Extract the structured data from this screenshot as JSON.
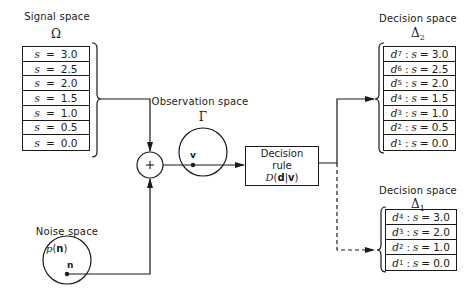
{
  "signal_space": {
    "title": "Signal space",
    "symbol": "Ω",
    "rows": [
      {
        "var": "s",
        "eq": "=",
        "value": "3.0"
      },
      {
        "var": "s",
        "eq": "=",
        "value": "2.5"
      },
      {
        "var": "s",
        "eq": "=",
        "value": "2.0"
      },
      {
        "var": "s",
        "eq": "=",
        "value": "1.5"
      },
      {
        "var": "s",
        "eq": "=",
        "value": "1.0"
      },
      {
        "var": "s",
        "eq": "=",
        "value": "0.5"
      },
      {
        "var": "s",
        "eq": "=",
        "value": "0.0"
      }
    ]
  },
  "noise_space": {
    "title": "Noise space",
    "density": "p(n)",
    "density_func": "p",
    "density_arg": "n",
    "point": "n"
  },
  "summer": {
    "symbol": "+"
  },
  "observation_space": {
    "title": "Observation space",
    "symbol": "Γ",
    "point": "v"
  },
  "decision_rule": {
    "line1": "Decision",
    "line2": "rule",
    "func": "D",
    "arg1": "d",
    "arg2": "v"
  },
  "decision_space_2": {
    "title": "Decision space",
    "symbol": "Δ",
    "subscript": "2",
    "rows": [
      {
        "d": "d",
        "sub": "7",
        "var": "s",
        "value": "3.0"
      },
      {
        "d": "d",
        "sub": "6",
        "var": "s",
        "value": "2.5"
      },
      {
        "d": "d",
        "sub": "5",
        "var": "s",
        "value": "2.0"
      },
      {
        "d": "d",
        "sub": "4",
        "var": "s",
        "value": "1.5"
      },
      {
        "d": "d",
        "sub": "3",
        "var": "s",
        "value": "1.0"
      },
      {
        "d": "d",
        "sub": "2",
        "var": "s",
        "value": "0.5"
      },
      {
        "d": "d",
        "sub": "1",
        "var": "s",
        "value": "0.0"
      }
    ]
  },
  "decision_space_1": {
    "title": "Decision space",
    "symbol": "Δ",
    "subscript": "1",
    "rows": [
      {
        "d": "d",
        "sub": "4",
        "var": "s",
        "value": "3.0"
      },
      {
        "d": "d",
        "sub": "3",
        "var": "s",
        "value": "2.0"
      },
      {
        "d": "d",
        "sub": "2",
        "var": "s",
        "value": "1.0"
      },
      {
        "d": "d",
        "sub": "1",
        "var": "s",
        "value": "0.0"
      }
    ]
  },
  "colors": {
    "ink": "#1a1a1a",
    "background": "#ffffff"
  }
}
